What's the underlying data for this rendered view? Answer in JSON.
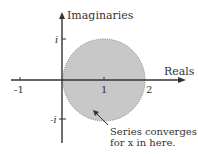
{
  "diagram": {
    "axes": {
      "x_label": "Reals",
      "y_label": "Imaginaries"
    },
    "x_ticks": [
      {
        "label": "-1",
        "value": -1
      },
      {
        "label": "1",
        "value": 1
      },
      {
        "label": "2",
        "value": 2
      }
    ],
    "y_ticks": [
      {
        "label": "i",
        "value": 1
      },
      {
        "label": "-i",
        "value": -1
      }
    ],
    "region": {
      "shape": "disk",
      "center": [
        1,
        0
      ],
      "radius": 1,
      "fill_color": "#c8c8c8",
      "border": "dotted"
    },
    "annotation": {
      "line1": "Series converges",
      "line2": "for x in here."
    },
    "colors": {
      "axis": "#333333",
      "fill": "#c8c8c8",
      "text": "#333333"
    }
  }
}
